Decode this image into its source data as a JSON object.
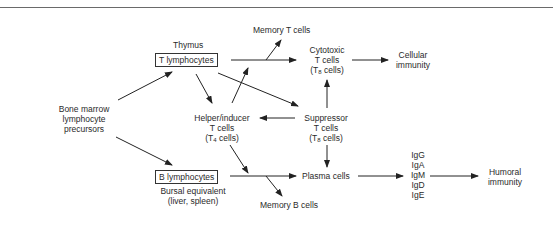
{
  "diagram": {
    "nodes": {
      "thymus": "Thymus",
      "t_lymphocytes": "T lymphocytes",
      "memory_t": "Memory T cells",
      "cytotoxic": [
        "Cytotoxic",
        "T cells"
      ],
      "cytotoxic_sub_prefix": "(T",
      "cytotoxic_sub": "8",
      "cytotoxic_sub_suffix": " cells)",
      "cellular": [
        "Cellular",
        "immunity"
      ],
      "bone_marrow": [
        "Bone marrow",
        "lymphocyte",
        "precursors"
      ],
      "helper": [
        "Helper/inducer",
        "T cells"
      ],
      "helper_sub_prefix": "(T",
      "helper_sub": "4",
      "helper_sub_suffix": " cells)",
      "suppressor": [
        "Suppressor",
        "T cells"
      ],
      "suppressor_sub_prefix": "(T",
      "suppressor_sub": "8",
      "suppressor_sub_suffix": " cells)",
      "b_lymphocytes": "B lymphocytes",
      "bursal": [
        "Bursal equivalent",
        "(liver, spleen)"
      ],
      "memory_b": "Memory B cells",
      "plasma": "Plasma cells",
      "immunoglobulins": [
        "IgG",
        "IgA",
        "IgM",
        "IgD",
        "IgE"
      ],
      "humoral": [
        "Humoral",
        "immunity"
      ]
    },
    "edges": [
      {
        "from": "bone_marrow",
        "to": "t_lymphocytes"
      },
      {
        "from": "bone_marrow",
        "to": "b_lymphocytes"
      },
      {
        "from": "t_lymphocytes",
        "to": "cytotoxic"
      },
      {
        "from": "t_lymphocytes",
        "to": "memory_t"
      },
      {
        "from": "t_lymphocytes",
        "to": "helper"
      },
      {
        "from": "t_lymphocytes",
        "to": "suppressor"
      },
      {
        "from": "helper",
        "to": "t_lymphocytes_line"
      },
      {
        "from": "suppressor",
        "to": "helper"
      },
      {
        "from": "suppressor",
        "to": "cytotoxic"
      },
      {
        "from": "suppressor",
        "to": "plasma"
      },
      {
        "from": "helper",
        "to": "b_lymphocytes_line"
      },
      {
        "from": "b_lymphocytes",
        "to": "plasma"
      },
      {
        "from": "b_lymphocytes",
        "to": "memory_b"
      },
      {
        "from": "cytotoxic",
        "to": "cellular"
      },
      {
        "from": "plasma",
        "to": "immunoglobulins"
      },
      {
        "from": "immunoglobulins",
        "to": "humoral"
      }
    ]
  }
}
